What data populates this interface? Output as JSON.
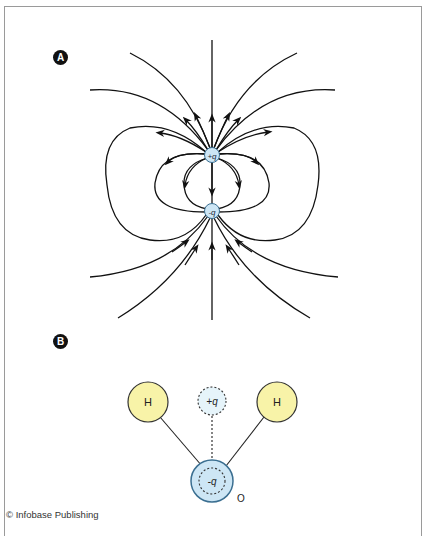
{
  "figure": {
    "panel_a": {
      "label": "A",
      "positive_charge": "+q",
      "negative_charge": "-q"
    },
    "panel_b": {
      "label": "B",
      "hydrogen_left": "H",
      "hydrogen_right": "H",
      "partial_positive": "+q",
      "partial_negative": "-q",
      "oxygen_label": "O"
    },
    "credit": "© Infobase Publishing",
    "colors": {
      "charge_fill": "#cde6f5",
      "charge_stroke": "#3b6f91",
      "hydrogen_fill": "#f8f3a8",
      "field_line": "#111111",
      "frame": "#9a9a9a"
    }
  }
}
